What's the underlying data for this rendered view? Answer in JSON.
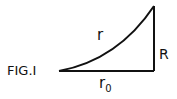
{
  "figure": {
    "caption": "FIG.I",
    "labels": {
      "curve": "r",
      "vertical": "R",
      "base_main": "r",
      "base_sub": "0"
    },
    "colors": {
      "stroke": "#111111",
      "background": "#ffffff"
    }
  }
}
